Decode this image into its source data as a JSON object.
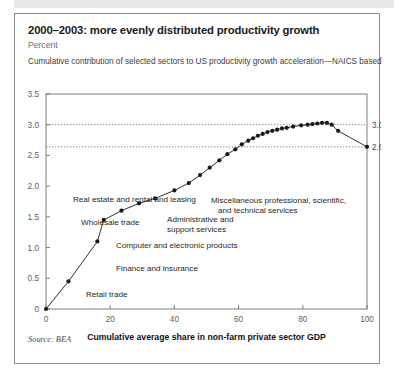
{
  "figure": {
    "title": "2000–2003: more evenly distributed productivity growth",
    "unit": "Percent",
    "subtitle": "Cumulative contribution of selected sectors to US productivity growth acceleration—NAICS based",
    "source": "Source: BEA"
  },
  "chart_data": {
    "type": "line",
    "title": "2000–2003: more evenly distributed productivity growth",
    "subtitle": "Cumulative contribution of selected sectors to US productivity growth acceleration—NAICS based",
    "xlabel": "Cumulative average share in non-farm private sector GDP",
    "ylabel": "Percent",
    "xlim": [
      0,
      100
    ],
    "ylim": [
      0,
      3.5
    ],
    "xticks": [
      0,
      20,
      40,
      60,
      80,
      100
    ],
    "xtick_labels": [
      "0",
      "20",
      "40",
      "60",
      "80",
      "100"
    ],
    "yticks": [
      0,
      0.5,
      1.0,
      1.5,
      2.0,
      2.5,
      3.0,
      3.5
    ],
    "ytick_labels": [
      "0",
      "0.5",
      "1.0",
      "1.5",
      "2.0",
      "2.5",
      "3.0",
      "3.5"
    ],
    "grid": false,
    "legend": "none",
    "reference_lines": [
      {
        "value": 3.0,
        "label": "3.00",
        "style": "dotted"
      },
      {
        "value": 2.64,
        "label": "2.64",
        "style": "dotted"
      }
    ],
    "series": [
      {
        "name": "Cumulative contribution",
        "marker": "circle",
        "color": "#1a1a1a",
        "x": [
          0,
          7,
          16,
          18,
          23.5,
          29,
          34,
          40,
          44.5,
          48,
          51,
          54,
          56.5,
          59,
          61,
          63,
          64.5,
          66,
          67.5,
          69,
          70.5,
          72,
          73.5,
          75,
          77,
          79.5,
          81.5,
          83,
          84.5,
          86,
          87.5,
          89,
          91,
          100
        ],
        "y": [
          0,
          0.45,
          1.1,
          1.45,
          1.6,
          1.72,
          1.8,
          1.93,
          2.05,
          2.18,
          2.3,
          2.42,
          2.52,
          2.6,
          2.68,
          2.74,
          2.78,
          2.82,
          2.85,
          2.88,
          2.9,
          2.92,
          2.94,
          2.95,
          2.97,
          2.99,
          3.0,
          3.01,
          3.02,
          3.03,
          3.03,
          3.0,
          2.9,
          2.64
        ]
      }
    ],
    "annotations": [
      {
        "text": "Retail trade",
        "x_px": 71,
        "y_px": 283
      },
      {
        "text": "Finance and insurance",
        "x_px": 101,
        "y_px": 257
      },
      {
        "text": "Computer and electronic products",
        "x_px": 101,
        "y_px": 234
      },
      {
        "text": "Wholesale trade",
        "x_px": 66,
        "y_px": 211
      },
      {
        "text": "Administrative and",
        "x_px": 152,
        "y_px": 208
      },
      {
        "text": "support services",
        "x_px": 152,
        "y_px": 218
      },
      {
        "text": "Real estate and rental and leasing",
        "x_px": 58,
        "y_px": 188
      },
      {
        "text": "Miscellaneous professional, scientific,",
        "x_px": 196,
        "y_px": 189
      },
      {
        "text": "and technical services",
        "x_px": 203,
        "y_px": 199
      }
    ],
    "endpoint_labels": [
      {
        "text": "3.00",
        "value": 3.0
      },
      {
        "text": "2.64",
        "value": 2.64
      }
    ]
  }
}
